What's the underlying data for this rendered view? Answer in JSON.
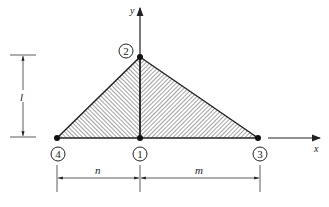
{
  "diagram": {
    "axes": {
      "x_label": "x",
      "y_label": "y"
    },
    "nodes": [
      {
        "id": "1",
        "label": "1"
      },
      {
        "id": "2",
        "label": "2"
      },
      {
        "id": "3",
        "label": "3"
      },
      {
        "id": "4",
        "label": "4"
      }
    ],
    "dimensions": {
      "height": "l",
      "left_width": "n",
      "right_width": "m"
    },
    "colors": {
      "line": "#222222",
      "hatch": "#333333",
      "background": "#ffffff"
    }
  }
}
